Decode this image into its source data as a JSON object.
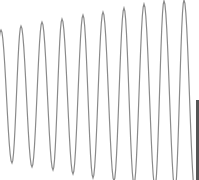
{
  "chart_data": {
    "type": "line",
    "title": "",
    "xlabel": "",
    "ylabel": "",
    "grid": false,
    "legend": null,
    "series": [
      {
        "name": "signal",
        "color": "#8a8a8a",
        "peaks": [
          {
            "x": 1,
            "y": 30
          },
          {
            "x": 21,
            "y": 26
          },
          {
            "x": 42,
            "y": 22
          },
          {
            "x": 62,
            "y": 19
          },
          {
            "x": 83,
            "y": 15
          },
          {
            "x": 103,
            "y": 12
          },
          {
            "x": 124,
            "y": 8
          },
          {
            "x": 144,
            "y": 4
          },
          {
            "x": 164,
            "y": 1
          },
          {
            "x": 184,
            "y": 0
          }
        ],
        "troughs": [
          {
            "x": 12,
            "y": 163
          },
          {
            "x": 32,
            "y": 167
          },
          {
            "x": 53,
            "y": 170
          },
          {
            "x": 73,
            "y": 174
          },
          {
            "x": 93,
            "y": 178
          },
          {
            "x": 114,
            "y": 181
          },
          {
            "x": 134,
            "y": 184
          },
          {
            "x": 155,
            "y": 187
          },
          {
            "x": 175,
            "y": 190
          },
          {
            "x": 195,
            "y": 193
          }
        ]
      }
    ],
    "xlim": [
      0,
      199
    ],
    "ylim": [
      0,
      180
    ]
  },
  "colors": {
    "background": "#ffffff",
    "line": "#8a8a8a",
    "edge_bar": "#555555"
  }
}
